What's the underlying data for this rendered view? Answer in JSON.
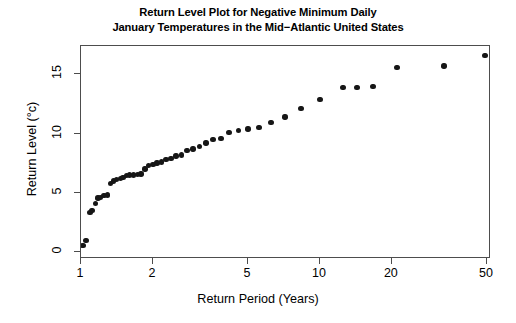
{
  "chart": {
    "title_line1": "Return Level Plot for Negative Minimum Daily",
    "title_line2": "January Temperatures in the Mid−Atlantic United States",
    "xlabel": "Return Period (Years)",
    "ylabel": "Return Level (°c)"
  },
  "chart_data": {
    "type": "scatter",
    "title": "Return Level Plot for Negative Minimum Daily January Temperatures in the Mid−Atlantic United States",
    "xlabel": "Return Period (Years)",
    "ylabel": "Return Level (°c)",
    "xscale": "log",
    "yscale": "linear",
    "xlim": [
      1.0,
      52.0
    ],
    "ylim": [
      -0.6,
      17.4
    ],
    "grid": false,
    "legend": null,
    "xticks": [
      1,
      2,
      5,
      10,
      20,
      50
    ],
    "xtick_labels": [
      "1",
      "2",
      "5",
      "10",
      "20",
      "50"
    ],
    "yticks": [
      0,
      5,
      10,
      15
    ],
    "ytick_labels": [
      "0",
      "5",
      "10",
      "15"
    ],
    "marker": "filled-circle",
    "marker_color": "#161616",
    "point_count": 48,
    "x": [
      1.02,
      1.05,
      1.09,
      1.11,
      1.15,
      1.18,
      1.21,
      1.25,
      1.29,
      1.33,
      1.37,
      1.41,
      1.46,
      1.5,
      1.55,
      1.6,
      1.66,
      1.72,
      1.78,
      1.85,
      1.92,
      2.0,
      2.08,
      2.17,
      2.27,
      2.38,
      2.5,
      2.63,
      2.78,
      2.94,
      3.13,
      3.33,
      3.57,
      3.85,
      4.17,
      4.55,
      5.0,
      5.56,
      6.25,
      7.14,
      8.33,
      10.0,
      12.5,
      14.3,
      16.7,
      21.0,
      33.0,
      49.0
    ],
    "y": [
      0.55,
      0.95,
      3.35,
      3.5,
      4.1,
      4.55,
      4.6,
      4.75,
      4.8,
      5.8,
      6.0,
      6.1,
      6.2,
      6.3,
      6.45,
      6.5,
      6.5,
      6.55,
      6.6,
      7.0,
      7.3,
      7.4,
      7.5,
      7.6,
      7.8,
      7.9,
      8.1,
      8.2,
      8.55,
      8.7,
      8.9,
      9.2,
      9.5,
      9.6,
      10.1,
      10.25,
      10.4,
      10.5,
      10.95,
      11.4,
      12.1,
      12.9,
      13.9,
      13.9,
      14.0,
      15.6,
      15.7,
      16.6
    ]
  }
}
